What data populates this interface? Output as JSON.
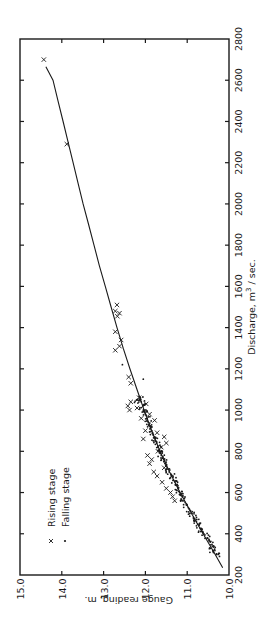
{
  "chart_data": {
    "type": "scatter",
    "orientation": "rotated-90-clockwise",
    "title": "",
    "xlabel": "Discharge, m3/sec.",
    "xlabel_parts": {
      "prefix": "Discharge,  m",
      "sup": "3",
      "suffix": " / sec."
    },
    "ylabel": "Gauge reading, m.",
    "xlim": [
      200,
      2800
    ],
    "ylim": [
      10.0,
      15.0
    ],
    "x_ticks": [
      200,
      400,
      600,
      800,
      1000,
      1200,
      1400,
      1600,
      1800,
      2000,
      2200,
      2400,
      2600,
      2800
    ],
    "y_ticks": [
      "10.0",
      "11.0",
      "12.0",
      "13.0",
      "14.0",
      "15.0"
    ],
    "grid": false,
    "legend": {
      "position": "upper-left (rotated view)",
      "entries": [
        {
          "marker": "x",
          "label": "Rising stage"
        },
        {
          "marker": "•",
          "label": "Falling stage"
        }
      ]
    },
    "series": [
      {
        "name": "Rating curve",
        "kind": "line",
        "points": [
          [
            235,
            10.15
          ],
          [
            300,
            10.33
          ],
          [
            400,
            10.62
          ],
          [
            500,
            10.9
          ],
          [
            600,
            11.17
          ],
          [
            700,
            11.42
          ],
          [
            800,
            11.65
          ],
          [
            900,
            11.85
          ],
          [
            1000,
            12.03
          ],
          [
            1100,
            12.2
          ],
          [
            1200,
            12.37
          ],
          [
            1300,
            12.53
          ],
          [
            1400,
            12.68
          ],
          [
            1500,
            12.82
          ],
          [
            1600,
            12.96
          ],
          [
            1700,
            13.1
          ],
          [
            1800,
            13.23
          ],
          [
            1900,
            13.36
          ],
          [
            2000,
            13.49
          ],
          [
            2100,
            13.61
          ],
          [
            2200,
            13.73
          ],
          [
            2300,
            13.85
          ],
          [
            2400,
            13.97
          ],
          [
            2500,
            14.09
          ],
          [
            2600,
            14.21
          ],
          [
            2665,
            14.38
          ]
        ]
      },
      {
        "name": "Rising stage",
        "kind": "scatter",
        "marker": "x",
        "points": [
          [
            2700,
            14.43
          ],
          [
            2290,
            13.88
          ],
          [
            1510,
            12.68
          ],
          [
            1470,
            12.62
          ],
          [
            1455,
            12.67
          ],
          [
            1480,
            12.72
          ],
          [
            1380,
            12.72
          ],
          [
            1310,
            12.62
          ],
          [
            1290,
            12.72
          ],
          [
            1340,
            12.58
          ],
          [
            1160,
            12.4
          ],
          [
            1130,
            12.35
          ],
          [
            1060,
            12.15
          ],
          [
            1040,
            12.35
          ],
          [
            1020,
            12.42
          ],
          [
            1000,
            12.38
          ],
          [
            1030,
            11.98
          ],
          [
            980,
            11.9
          ],
          [
            950,
            11.78
          ],
          [
            890,
            11.72
          ],
          [
            870,
            11.55
          ],
          [
            840,
            11.5
          ],
          [
            820,
            11.62
          ],
          [
            900,
            12.0
          ],
          [
            860,
            12.05
          ],
          [
            780,
            11.95
          ],
          [
            760,
            11.85
          ],
          [
            740,
            11.9
          ],
          [
            700,
            11.8
          ],
          [
            680,
            11.72
          ],
          [
            650,
            11.6
          ],
          [
            620,
            11.5
          ],
          [
            600,
            11.4
          ],
          [
            580,
            11.35
          ],
          [
            560,
            11.3
          ],
          [
            720,
            11.55
          ],
          [
            800,
            11.7
          ],
          [
            960,
            12.1
          ],
          [
            1010,
            12.2
          ]
        ]
      },
      {
        "name": "Falling stage",
        "kind": "scatter",
        "marker": "dot",
        "points": [
          [
            1150,
            12.05
          ],
          [
            1220,
            12.55
          ],
          [
            1050,
            12.2
          ],
          [
            300,
            10.3
          ],
          [
            320,
            10.38
          ],
          [
            340,
            10.4
          ],
          [
            360,
            10.45
          ],
          [
            380,
            10.52
          ],
          [
            400,
            10.6
          ],
          [
            420,
            10.65
          ],
          [
            440,
            10.72
          ],
          [
            460,
            10.78
          ],
          [
            480,
            10.85
          ],
          [
            500,
            10.9
          ],
          [
            520,
            10.95
          ],
          [
            540,
            11.02
          ],
          [
            560,
            11.08
          ],
          [
            580,
            11.12
          ],
          [
            600,
            11.18
          ],
          [
            620,
            11.22
          ],
          [
            640,
            11.28
          ],
          [
            660,
            11.33
          ],
          [
            680,
            11.38
          ],
          [
            700,
            11.43
          ],
          [
            720,
            11.48
          ],
          [
            740,
            11.52
          ],
          [
            760,
            11.56
          ],
          [
            780,
            11.62
          ],
          [
            800,
            11.66
          ],
          [
            820,
            11.7
          ],
          [
            840,
            11.73
          ],
          [
            860,
            11.77
          ],
          [
            880,
            11.81
          ],
          [
            900,
            11.85
          ],
          [
            920,
            11.89
          ],
          [
            940,
            11.93
          ],
          [
            960,
            11.96
          ],
          [
            980,
            12.0
          ],
          [
            1000,
            12.03
          ],
          [
            1020,
            12.06
          ],
          [
            1040,
            12.1
          ],
          [
            1060,
            12.12
          ]
        ]
      }
    ]
  }
}
